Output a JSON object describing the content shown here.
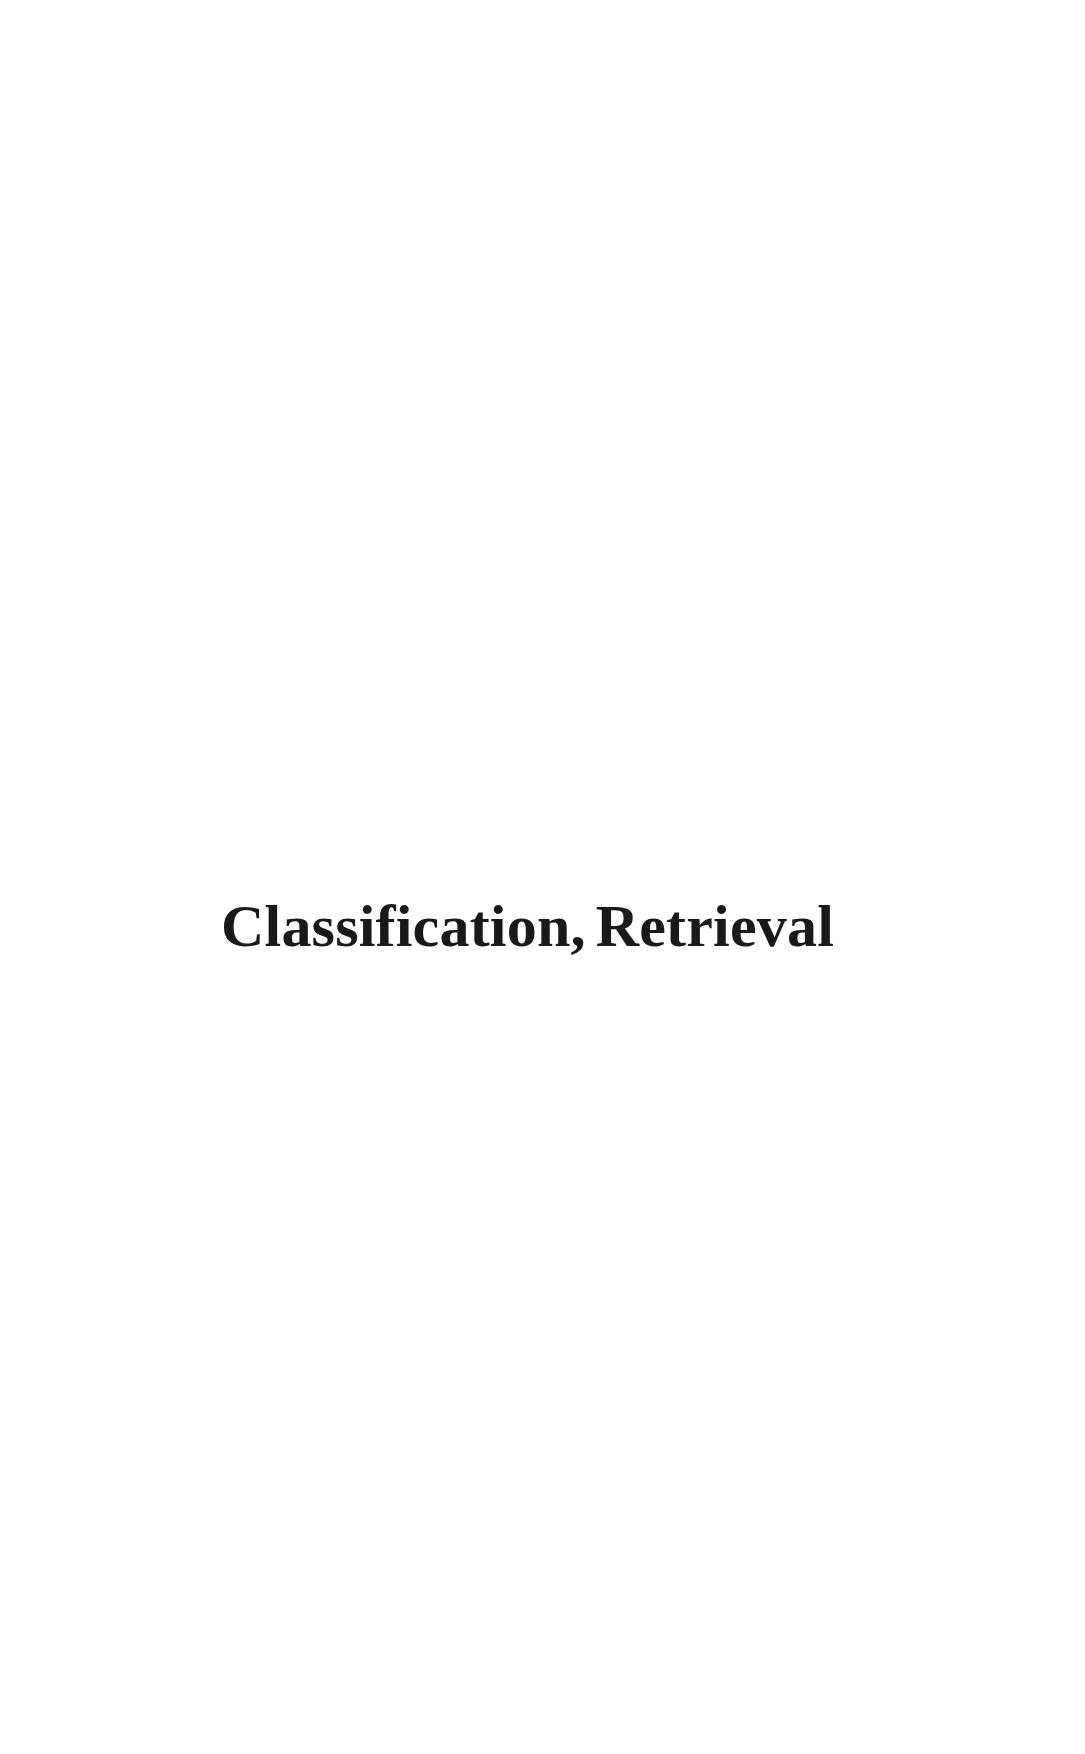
{
  "page": {
    "kind": "book-section-divider-page",
    "width": 1085,
    "height": 1754,
    "background_color": "#ffffff",
    "ink_color": "#1a1818"
  },
  "section_title": {
    "text": "Classification, Retrieval",
    "first_part": "Classification,",
    "second_part": "Retrieval"
  }
}
